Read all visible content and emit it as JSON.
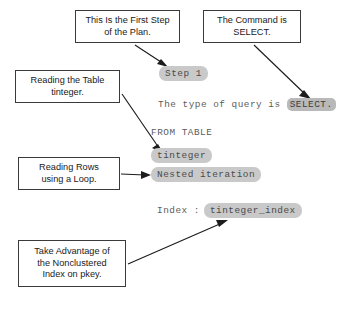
{
  "diagram": {
    "colors": {
      "pill_fill": "#c9c9c9",
      "pill_strong_fill": "#b9b9b9",
      "plan_text": "#5c5c5c",
      "box_border": "#3a3a3a",
      "arrow": "#1c1c1c",
      "background": "#ffffff"
    },
    "callouts": [
      {
        "id": "first-step",
        "lines": [
          "This Is the First Step",
          "of the Plan."
        ]
      },
      {
        "id": "command",
        "lines": [
          "The Command is",
          "SELECT."
        ]
      },
      {
        "id": "table",
        "lines": [
          "Reading the Table",
          "tinteger."
        ]
      },
      {
        "id": "rows",
        "lines": [
          "Reading Rows",
          "using a Loop."
        ]
      },
      {
        "id": "index",
        "lines": [
          "Take Advantage of",
          "the Nonclustered",
          "Index on pkey."
        ]
      }
    ],
    "plan": {
      "step_label": "Step 1",
      "query_type_prefix": "The type of query is ",
      "query_type_value": "SELECT.",
      "from_clause": "FROM TABLE",
      "table_name": "tinteger",
      "iteration": "Nested iteration",
      "index_label": "Index :",
      "index_name": "tinteger_index"
    }
  }
}
